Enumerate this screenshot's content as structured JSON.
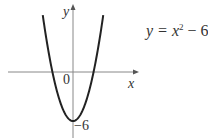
{
  "chart_data": {
    "type": "line",
    "title": "",
    "equation": "y = x² − 6",
    "equation_parts": {
      "lhs": "y = x",
      "exp": "2",
      "rhs": " − 6"
    },
    "xlabel": "x",
    "ylabel": "y",
    "origin_label": "0",
    "y_intercept_label": "−6",
    "series": [
      {
        "name": "y = x^2 - 6",
        "x": [
          -3,
          -2.449,
          -2,
          -1,
          0,
          1,
          2,
          2.449,
          3
        ],
        "y": [
          3,
          0,
          -2,
          -5,
          -6,
          -5,
          -2,
          0,
          3
        ]
      }
    ],
    "vertex": [
      0,
      -6
    ],
    "roots": [
      -2.449,
      2.449
    ],
    "grid": false,
    "colors": {
      "curve": "#222222",
      "axes": "#888888"
    }
  }
}
